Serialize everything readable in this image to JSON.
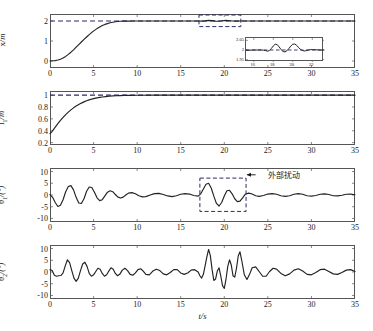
{
  "figure": {
    "xlabel": "t/s",
    "xlim": [
      0,
      35
    ],
    "xticks": [
      "0",
      "5",
      "10",
      "15",
      "20",
      "25",
      "30",
      "35"
    ],
    "xtick_values": [
      0,
      5,
      10,
      15,
      20,
      25,
      30,
      35
    ],
    "line_color": "#222222",
    "dash_color": "#2b2b6b",
    "annotation_text": "外部扰动"
  },
  "chart_data": [
    {
      "type": "line",
      "name": "cart-position",
      "title": "",
      "xlabel": "",
      "ylabel": "x/m",
      "ylabel_main": "x",
      "ylabel_sub": "",
      "ylabel_unit": "/m",
      "xlim": [
        0,
        35
      ],
      "ylim": [
        -0.35,
        2.35
      ],
      "yticks": [
        "0",
        "1",
        "2"
      ],
      "ytick_values": [
        0,
        1,
        2
      ],
      "grid": false,
      "reference_line": {
        "value": 2,
        "style": "dashed",
        "label": "2"
      },
      "callout_box": {
        "x0": 17.1,
        "x1": 21.9,
        "y0": 1.72,
        "y1": 2.3,
        "style": "dashed"
      },
      "inset": {
        "xlim": [
          15.2,
          23.2
        ],
        "ylim": [
          1.938,
          2.062
        ],
        "xticks": [
          "16",
          "18",
          "20",
          "22"
        ],
        "xtick_values": [
          16,
          18,
          20,
          22
        ],
        "yticks": [
          "1.95",
          "2",
          "2.05"
        ],
        "ytick_values": [
          1.95,
          2,
          2.05
        ],
        "reference_line": 2,
        "x": [
          15.2,
          15.6,
          16.0,
          16.4,
          16.8,
          17.0,
          17.2,
          17.4,
          17.6,
          17.8,
          18.0,
          18.2,
          18.4,
          18.6,
          18.8,
          19.0,
          19.2,
          19.4,
          19.6,
          19.8,
          20.0,
          20.2,
          20.4,
          20.6,
          20.8,
          21.0,
          21.2,
          21.4,
          21.6,
          21.8,
          22.0,
          22.4,
          22.8,
          23.2
        ],
        "y": [
          1.999,
          1.999,
          2.0,
          2.0,
          2.0,
          1.999,
          1.997,
          1.994,
          1.997,
          2.008,
          2.021,
          2.03,
          2.028,
          2.016,
          2.002,
          1.992,
          1.99,
          1.996,
          2.008,
          2.021,
          2.03,
          2.031,
          2.024,
          2.012,
          2.003,
          1.997,
          1.995,
          1.997,
          2.0,
          2.002,
          2.002,
          2.001,
          2.0,
          2.0
        ]
      },
      "x": [
        0,
        0.3,
        0.6,
        0.9,
        1.2,
        1.5,
        1.8,
        2.1,
        2.4,
        2.7,
        3.0,
        3.3,
        3.6,
        3.9,
        4.2,
        4.5,
        4.8,
        5.1,
        5.4,
        5.7,
        6.0,
        6.3,
        6.6,
        6.9,
        7.2,
        7.5,
        7.8,
        8.1,
        8.4,
        8.7,
        9.0,
        9.5,
        10,
        11,
        12,
        13,
        14,
        15,
        16,
        17,
        17.4,
        17.8,
        18.2,
        18.6,
        19.0,
        19.4,
        19.8,
        20.2,
        20.6,
        21.0,
        21.4,
        21.8,
        22.2,
        23,
        24,
        25,
        26,
        27,
        28,
        29,
        30,
        31,
        32,
        33,
        34,
        35
      ],
      "y": [
        0.0,
        0.01,
        0.02,
        0.05,
        0.09,
        0.15,
        0.23,
        0.33,
        0.44,
        0.56,
        0.69,
        0.82,
        0.95,
        1.08,
        1.2,
        1.32,
        1.43,
        1.53,
        1.62,
        1.7,
        1.77,
        1.83,
        1.87,
        1.91,
        1.94,
        1.96,
        1.975,
        1.985,
        1.991,
        1.995,
        1.997,
        1.999,
        2.0,
        2.0,
        2.0,
        2.0,
        2.0,
        2.0,
        2.0,
        1.999,
        1.995,
        2.005,
        2.028,
        2.022,
        1.995,
        1.99,
        2.01,
        2.03,
        2.015,
        1.998,
        1.996,
        2.001,
        2.002,
        2.001,
        2.0,
        2.0,
        2.0,
        2.0,
        2.0,
        2.0,
        2.0,
        2.0,
        2.0,
        2.0,
        2.0,
        2.0
      ]
    },
    {
      "type": "line",
      "name": "rope-length-1",
      "title": "",
      "xlabel": "",
      "ylabel": "l1/m",
      "ylabel_main": "l",
      "ylabel_sub": "1",
      "ylabel_unit": "/m",
      "xlim": [
        0,
        35
      ],
      "ylim": [
        0.16,
        1.07
      ],
      "yticks": [
        "0.2",
        "0.4",
        "0.6",
        "0.8",
        "1"
      ],
      "ytick_values": [
        0.2,
        0.4,
        0.6,
        0.8,
        1.0
      ],
      "grid": false,
      "reference_line": {
        "value": 1,
        "style": "dashed",
        "label": "1"
      },
      "x": [
        0,
        0.2,
        0.4,
        0.6,
        0.9,
        1.2,
        1.5,
        1.8,
        2.1,
        2.4,
        2.7,
        3.0,
        3.3,
        3.6,
        3.9,
        4.2,
        4.5,
        4.8,
        5.1,
        5.4,
        5.7,
        6.0,
        6.4,
        6.8,
        7.2,
        7.6,
        8.0,
        8.5,
        9.0,
        10,
        12,
        14,
        16,
        18,
        20,
        22,
        24,
        26,
        28,
        30,
        32,
        34,
        35
      ],
      "y": [
        0.35,
        0.38,
        0.42,
        0.46,
        0.52,
        0.575,
        0.625,
        0.672,
        0.714,
        0.752,
        0.786,
        0.816,
        0.843,
        0.866,
        0.887,
        0.905,
        0.921,
        0.934,
        0.945,
        0.955,
        0.963,
        0.969,
        0.976,
        0.982,
        0.987,
        0.99,
        0.993,
        0.996,
        0.997,
        0.999,
        1.0,
        1.0,
        1.0,
        1.0,
        1.0,
        1.0,
        1.0,
        1.0,
        1.0,
        1.0,
        1.0,
        1.0,
        1.0
      ]
    },
    {
      "type": "line",
      "name": "swing-angle-1",
      "title": "",
      "xlabel": "",
      "ylabel": "θ1/(°)",
      "ylabel_main": "θ",
      "ylabel_sub": "1",
      "ylabel_unit": "/(°)",
      "xlim": [
        0,
        35
      ],
      "ylim": [
        -11.5,
        11.5
      ],
      "yticks": [
        "10",
        "5",
        "0",
        "-5",
        "-10"
      ],
      "ytick_values": [
        10,
        5,
        0,
        -5,
        -10
      ],
      "grid": false,
      "callout_box": {
        "x0": 17.2,
        "x1": 22.5,
        "y0": -7.0,
        "y1": 7.2,
        "style": "dashed"
      },
      "annotation": {
        "text": "外部扰动",
        "x": 25.0,
        "y": 8.6,
        "arrow_from_x": 23.6,
        "arrow_to_x": 22.6
      },
      "x": [
        0,
        0.3,
        0.6,
        0.9,
        1.2,
        1.5,
        1.8,
        2.1,
        2.4,
        2.7,
        3.0,
        3.3,
        3.6,
        3.9,
        4.2,
        4.5,
        4.8,
        5.1,
        5.4,
        5.7,
        6.0,
        6.3,
        6.6,
        6.9,
        7.2,
        7.5,
        7.8,
        8.1,
        8.4,
        8.7,
        9.0,
        9.4,
        9.8,
        10.2,
        10.6,
        11.0,
        11.5,
        12.0,
        12.5,
        13.0,
        13.5,
        14.0,
        14.5,
        15.0,
        15.5,
        16.0,
        16.5,
        17.0,
        17.3,
        17.6,
        17.9,
        18.2,
        18.5,
        18.8,
        19.1,
        19.4,
        19.7,
        20.0,
        20.3,
        20.6,
        20.9,
        21.2,
        21.5,
        21.8,
        22.1,
        22.4,
        22.8,
        23.2,
        23.6,
        24.0,
        24.5,
        25.0,
        25.5,
        26.0,
        26.5,
        27.0,
        27.5,
        28.0,
        28.5,
        29.0,
        29.5,
        30.0,
        30.5,
        31.0,
        31.5,
        32.0,
        32.5,
        33.0,
        33.5,
        34.0,
        34.5,
        35.0
      ],
      "y": [
        0.2,
        -1.0,
        -3.2,
        -4.9,
        -4.4,
        -2.0,
        1.4,
        3.6,
        4.0,
        2.2,
        -1.0,
        -3.4,
        -3.6,
        -1.6,
        1.6,
        3.4,
        3.2,
        1.2,
        -1.2,
        -2.4,
        -2.0,
        -0.4,
        1.2,
        1.8,
        1.4,
        0.2,
        -0.9,
        -1.3,
        -0.9,
        0.0,
        0.8,
        1.0,
        0.5,
        -0.3,
        -0.8,
        -0.7,
        0.0,
        0.6,
        0.7,
        0.2,
        -0.4,
        -0.7,
        -0.3,
        0.3,
        0.6,
        0.4,
        -0.2,
        -0.5,
        0.5,
        2.6,
        4.6,
        5.0,
        3.0,
        -0.5,
        -3.6,
        -4.7,
        -3.2,
        -0.4,
        1.8,
        2.0,
        0.5,
        -1.6,
        -2.8,
        -2.6,
        -1.2,
        0.3,
        0.8,
        0.4,
        -0.3,
        -0.6,
        -0.2,
        0.4,
        0.6,
        0.3,
        -0.3,
        -0.6,
        -0.3,
        0.3,
        0.6,
        0.3,
        -0.3,
        -0.5,
        -0.2,
        0.3,
        0.5,
        0.2,
        -0.3,
        -0.4,
        -0.1,
        0.3,
        0.4,
        0.1
      ]
    },
    {
      "type": "line",
      "name": "swing-angle-2",
      "title": "",
      "xlabel": "t/s",
      "ylabel": "θ2/(°)",
      "ylabel_main": "θ",
      "ylabel_sub": "2",
      "ylabel_unit": "/(°)",
      "xlim": [
        0,
        35
      ],
      "ylim": [
        -11.5,
        11.5
      ],
      "yticks": [
        "10",
        "5",
        "0",
        "-5",
        "-10"
      ],
      "ytick_values": [
        10,
        5,
        0,
        -5,
        -10
      ],
      "grid": false,
      "x": [
        0,
        0.25,
        0.5,
        0.75,
        1.0,
        1.25,
        1.5,
        1.75,
        2.0,
        2.25,
        2.5,
        2.75,
        3.0,
        3.25,
        3.5,
        3.75,
        4.0,
        4.25,
        4.5,
        4.75,
        5.0,
        5.25,
        5.5,
        5.75,
        6.0,
        6.25,
        6.5,
        6.75,
        7.0,
        7.25,
        7.5,
        7.75,
        8.0,
        8.3,
        8.6,
        8.9,
        9.2,
        9.5,
        9.8,
        10.1,
        10.4,
        10.7,
        11.0,
        11.4,
        11.8,
        12.2,
        12.6,
        13.0,
        13.4,
        13.8,
        14.2,
        14.6,
        15.0,
        15.4,
        15.8,
        16.2,
        16.6,
        17.0,
        17.2,
        17.4,
        17.6,
        17.8,
        18.0,
        18.2,
        18.4,
        18.6,
        18.8,
        19.0,
        19.2,
        19.4,
        19.6,
        19.8,
        20.0,
        20.2,
        20.4,
        20.6,
        20.8,
        21.0,
        21.2,
        21.4,
        21.6,
        21.8,
        22.0,
        22.3,
        22.6,
        22.9,
        23.2,
        23.6,
        24.0,
        24.4,
        24.8,
        25.2,
        25.6,
        26.0,
        26.5,
        27.0,
        27.5,
        28.0,
        28.5,
        29.0,
        29.5,
        30.0,
        30.5,
        31.0,
        31.5,
        32.0,
        32.5,
        33.0,
        33.5,
        34.0,
        34.5,
        35.0
      ],
      "y": [
        1.0,
        0.6,
        -1.4,
        -1.8,
        -1.6,
        -1.5,
        -0.4,
        2.6,
        5.2,
        4.0,
        0.6,
        -2.6,
        -4.0,
        -2.6,
        0.6,
        3.4,
        4.2,
        2.4,
        -0.6,
        -1.8,
        -1.2,
        0.2,
        1.6,
        1.2,
        -0.6,
        -1.8,
        -1.2,
        0.4,
        1.8,
        1.2,
        -0.6,
        -1.6,
        -1.0,
        0.8,
        1.6,
        0.6,
        -1.0,
        -1.4,
        -0.4,
        1.0,
        1.4,
        0.4,
        -1.0,
        -1.2,
        0.4,
        1.2,
        0.6,
        -0.8,
        -1.2,
        -0.2,
        1.0,
        1.0,
        -0.4,
        -1.0,
        -0.4,
        0.8,
        1.0,
        0.0,
        -1.6,
        -2.6,
        -1.0,
        2.6,
        6.4,
        9.6,
        7.0,
        1.0,
        -3.6,
        -3.0,
        0.4,
        1.8,
        -1.8,
        -5.8,
        -7.0,
        -3.0,
        2.4,
        5.2,
        3.0,
        -1.6,
        -2.2,
        1.6,
        6.8,
        8.6,
        5.0,
        -1.2,
        -3.2,
        -1.0,
        1.8,
        2.2,
        0.2,
        -1.8,
        -1.8,
        0.2,
        1.6,
        1.2,
        -0.6,
        -1.6,
        -0.8,
        0.8,
        1.4,
        0.4,
        -1.0,
        -1.2,
        -0.2,
        1.0,
        1.2,
        0.2,
        -0.8,
        -1.0,
        -0.2,
        0.8,
        1.0,
        0.2,
        -0.6
      ]
    }
  ]
}
